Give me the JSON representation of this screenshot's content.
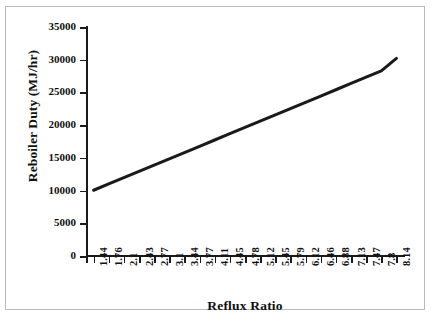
{
  "chart_data": {
    "type": "line",
    "title": "",
    "xlabel": "Reflux Ratio",
    "ylabel": "Reboiler Duty (MJ/hr)",
    "categories": [
      "1.44",
      "1.76",
      "2.1",
      "2.43",
      "2.77",
      "3.1",
      "3.44",
      "3.77",
      "4.11",
      "4.45",
      "4.78",
      "5.12",
      "5.45",
      "5.79",
      "6.12",
      "6.46",
      "6.88",
      "7.13",
      "7.47",
      "7.8",
      "8.14"
    ],
    "values": [
      10050,
      11010,
      11970,
      12930,
      13890,
      14850,
      15810,
      16770,
      17730,
      18690,
      19650,
      20610,
      21570,
      22530,
      23490,
      24450,
      25410,
      26370,
      27330,
      28290,
      30200
    ],
    "series": [
      {
        "name": "Reboiler Duty",
        "color": "#1a1a1a",
        "values": [
          10050,
          11010,
          11970,
          12930,
          13890,
          14850,
          15810,
          16770,
          17730,
          18690,
          19650,
          20610,
          21570,
          22530,
          23490,
          24450,
          25410,
          26370,
          27330,
          28290,
          30200
        ]
      }
    ],
    "ylim": [
      0,
      35000
    ],
    "yticks": [
      "0",
      "5000",
      "10000",
      "15000",
      "20000",
      "25000",
      "30000",
      "35000"
    ],
    "ytick_values": [
      0,
      5000,
      10000,
      15000,
      20000,
      25000,
      30000,
      35000
    ],
    "grid": false,
    "legend": false,
    "legend_position": "none",
    "line_start_value": 10050,
    "line_end_value": 30200
  },
  "figure": {
    "background_color": "#ffffff",
    "border_color": "#b9b9b9",
    "axis_color": "#1a1a1a",
    "text_color": "#111111"
  }
}
